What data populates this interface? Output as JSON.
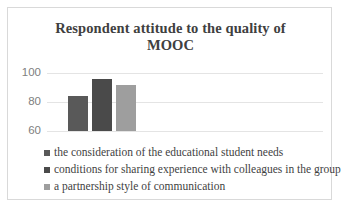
{
  "chart_data": {
    "type": "bar",
    "title": "Respondent attitude to the quality of MOOC",
    "title_line1": "Respondent attitude to the quality of",
    "title_line2": "MOOC",
    "xlabel": "",
    "ylabel": "",
    "ylim": [
      60,
      100
    ],
    "yticks": [
      100,
      80,
      60
    ],
    "grid": true,
    "legend_position": "bottom",
    "categories": [
      "the consideration of the educational student needs",
      "conditions for sharing experience with colleagues in the group",
      "a partnership style of communication"
    ],
    "values": [
      84,
      96,
      92
    ],
    "series": [
      {
        "name": "the consideration of the educational student needs",
        "value": 84,
        "color": "#595959"
      },
      {
        "name": "conditions for sharing experience with colleagues in the group",
        "value": 96,
        "color": "#4a4a4a"
      },
      {
        "name": "a partnership style of communication",
        "value": 92,
        "color": "#9e9e9e"
      }
    ]
  },
  "colors": {
    "frame_border": "#d9d9d9",
    "gridline": "#e4e4e4",
    "title_text": "#404040",
    "tick_text": "#808080",
    "legend_text": "#3f3f3f",
    "background": "#ffffff"
  }
}
